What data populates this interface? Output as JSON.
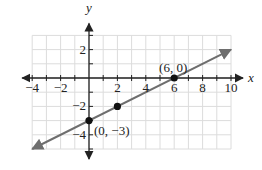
{
  "chart_data": {
    "type": "line",
    "title": "",
    "xlabel": "x",
    "ylabel": "y",
    "xlim": [
      -4,
      10
    ],
    "ylim": [
      -5,
      3
    ],
    "grid": true,
    "grid_step": 1,
    "x_ticks": [
      -4,
      -2,
      2,
      4,
      6,
      8,
      10
    ],
    "x_tick_labels": [
      "−4",
      "−2",
      "2",
      "4",
      "6",
      "8",
      "10"
    ],
    "y_ticks": [
      2,
      -2,
      -4
    ],
    "y_tick_labels": [
      "2",
      "−2",
      "−4"
    ],
    "series": [
      {
        "name": "line",
        "equation": "y = (1/2)x − 3",
        "slope": 0.5,
        "intercept": -3,
        "color": "#6e6e6e",
        "arrows_both_ends": true,
        "x_range": [
          -4,
          10
        ]
      }
    ],
    "points": [
      {
        "x": 0,
        "y": -3,
        "label": "(0, −3)"
      },
      {
        "x": 2,
        "y": -2,
        "label": ""
      },
      {
        "x": 6,
        "y": 0,
        "label": "(6, 0)"
      }
    ],
    "annotations": [
      "(6, 0)",
      "(0, −3)"
    ],
    "colors": {
      "grid": "#dcdcdc",
      "axis": "#222222",
      "line": "#6e6e6e",
      "point": "#111111"
    }
  }
}
